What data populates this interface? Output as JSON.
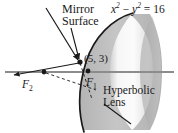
{
  "figure": {
    "kind": "hyperbolic-mirror-lens-diagram",
    "background_color": "#ffffff",
    "stroke_color": "#1a1a1a",
    "labels": {
      "mirror_line1": "Mirror",
      "mirror_line2": "Surface",
      "equation_x": "x",
      "equation_exp1": "2",
      "equation_minus": " − ",
      "equation_y": "y",
      "equation_exp2": "2",
      "equation_rhs": " = 16",
      "equation_full": "x2 − y2 = 16",
      "point": "(5, 3)",
      "focus2": "F",
      "focus2_sub": "2",
      "focus1": "F",
      "focus1_sub": "1",
      "lens_line1": "Hyperbolic",
      "lens_line2": "Lens"
    },
    "colors": {
      "lens_body_gray": "#bfbfbf",
      "lens_body_gray_dark": "#9a9a9a",
      "lens_highlight_light": "#f2f2f2",
      "lens_highlight_mid": "#dcdcdc",
      "axis_gray": "#8c8c8c",
      "curve_black": "#1a1a1a"
    },
    "points": {
      "reflection_point": {
        "x": 80,
        "y": 62,
        "label": "(5, 3)"
      },
      "focus_1": {
        "x": 88,
        "y": 72,
        "label": "F1"
      },
      "focus_2": {
        "x": 44,
        "y": 74,
        "label": "F2"
      }
    },
    "rays": {
      "incoming_start": {
        "x": 46,
        "y": 8
      },
      "incoming_end": {
        "x": 80,
        "y": 62
      },
      "reflected_start": {
        "x": 80,
        "y": 62
      },
      "reflected_end": {
        "x": 12,
        "y": 74
      }
    }
  }
}
